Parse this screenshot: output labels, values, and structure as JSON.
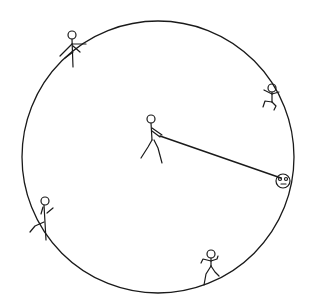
{
  "diagram": {
    "background": "#ffffff",
    "ink_color": "#1a1a1a",
    "circle": {
      "cx": 158,
      "cy": 157,
      "r": 136
    },
    "rope": {
      "x1": 163,
      "y1": 137,
      "x2": 282,
      "y2": 180
    },
    "figures": [
      {
        "id": "center-puller",
        "description": "stick figure in center pulling rope"
      },
      {
        "id": "top-left",
        "description": "stick figure on rim at top-left"
      },
      {
        "id": "top-right",
        "description": "stick figure on rim at top-right, legs bent"
      },
      {
        "id": "bottom-left",
        "description": "stick figure on rim at bottom-left"
      },
      {
        "id": "bottom",
        "description": "stick figure on rim at bottom, arms raised"
      },
      {
        "id": "face",
        "description": "smiley face at end of rope on right rim"
      }
    ]
  }
}
